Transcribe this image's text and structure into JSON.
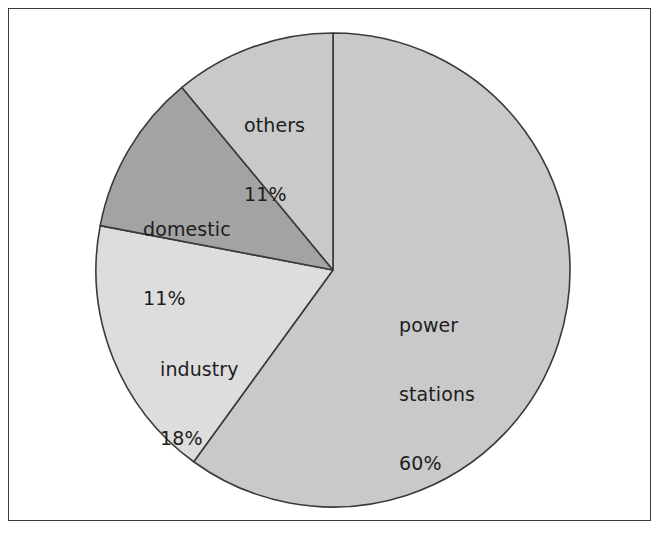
{
  "figure": {
    "background_color": "#ffffff",
    "frame_color": "#3a3a3a",
    "outline_color": "#3a3a3a"
  },
  "chart_data": {
    "type": "pie",
    "title": "",
    "subtitle": "",
    "xlabel": "",
    "ylabel": "",
    "grid": false,
    "legend_position": "none",
    "labels_inside_slices": true,
    "start_angle_deg": 0,
    "direction": "clockwise",
    "categories": [
      "power stations",
      "industry",
      "domestic",
      "others"
    ],
    "values": [
      60,
      18,
      11,
      11
    ],
    "value_unit": "%",
    "slices": [
      {
        "name": "power stations",
        "label": "power\nstations",
        "label_line1": "power",
        "label_line2": "stations",
        "value": 60,
        "value_text": "60%",
        "color": "#c9c9c9",
        "start_deg": 0,
        "end_deg": 216,
        "label_x": 399,
        "label_y": 268
      },
      {
        "name": "industry",
        "label": "industry",
        "value": 18,
        "value_text": "18%",
        "color": "#dddddd",
        "start_deg": 216,
        "end_deg": 280.8,
        "label_x": 160,
        "label_y": 312
      },
      {
        "name": "domestic",
        "label": "domestic",
        "value": 11,
        "value_text": "11%",
        "color": "#a3a3a3",
        "start_deg": 280.8,
        "end_deg": 320.4,
        "label_x": 143,
        "label_y": 172
      },
      {
        "name": "others",
        "label": "others",
        "value": 11,
        "value_text": "11%",
        "color": "#c9c9c9",
        "start_deg": 320.4,
        "end_deg": 360,
        "label_x": 244,
        "label_y": 68
      }
    ],
    "geometry": {
      "center_x": 333,
      "center_y": 270,
      "radius": 237
    }
  }
}
